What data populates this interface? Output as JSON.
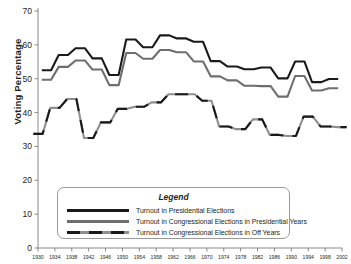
{
  "chart_data": {
    "type": "line",
    "title": "",
    "xlabel": "",
    "ylabel": "Voting Percentage",
    "ylim": [
      0,
      70
    ],
    "ytick_values": [
      0,
      10,
      20,
      30,
      40,
      50,
      60,
      70
    ],
    "ytick_labels": [
      "0",
      "10",
      "20",
      "30",
      "40",
      "50",
      "60",
      "70"
    ],
    "xlim": [
      1930,
      2002
    ],
    "xtick_labels": [
      "1930",
      "1934",
      "1938",
      "1942",
      "1946",
      "1950",
      "1954",
      "1958",
      "1962",
      "1966",
      "1970",
      "1974",
      "1978",
      "1982",
      "1986",
      "1990",
      "1994",
      "1998",
      "2002"
    ],
    "xtick_values": [
      1930,
      1934,
      1938,
      1942,
      1946,
      1950,
      1954,
      1958,
      1962,
      1966,
      1970,
      1974,
      1978,
      1982,
      1986,
      1990,
      1994,
      1998,
      2002
    ],
    "grid": false,
    "legend_position": "lower-center",
    "legend_title": "Legend",
    "series": [
      {
        "name": "Turnout in Presidential Elections",
        "color": "#1a1a1a",
        "style": "solid",
        "x": [
          1932,
          1936,
          1940,
          1944,
          1948,
          1952,
          1956,
          1960,
          1964,
          1968,
          1972,
          1976,
          1980,
          1984,
          1988,
          1992,
          1996,
          2000
        ],
        "values": [
          52.5,
          57.0,
          59.0,
          56.0,
          51.1,
          61.6,
          59.3,
          62.8,
          61.9,
          60.9,
          55.2,
          53.6,
          52.8,
          53.3,
          50.1,
          55.1,
          49.0,
          49.9
        ]
      },
      {
        "name": "Turnout in Congressional Elections in Presidential Years",
        "color": "#6e6e6e",
        "style": "solid",
        "x": [
          1932,
          1936,
          1940,
          1944,
          1948,
          1952,
          1956,
          1960,
          1964,
          1968,
          1972,
          1976,
          1980,
          1984,
          1988,
          1992,
          1996,
          2000
        ],
        "values": [
          49.7,
          53.5,
          55.4,
          52.7,
          48.1,
          57.6,
          55.9,
          58.5,
          57.8,
          55.1,
          50.7,
          49.5,
          47.9,
          47.8,
          44.7,
          50.8,
          46.5,
          47.2
        ]
      },
      {
        "name": "Turnout in Congressional Elections in Off Years",
        "color": "#1a1a1a",
        "style": "dashed",
        "x": [
          1930,
          1934,
          1938,
          1942,
          1946,
          1950,
          1954,
          1958,
          1962,
          1966,
          1970,
          1974,
          1978,
          1982,
          1986,
          1990,
          1994,
          1998,
          2002
        ],
        "values": [
          33.7,
          41.4,
          44.0,
          32.5,
          37.1,
          41.1,
          41.7,
          43.0,
          45.4,
          45.4,
          43.5,
          35.9,
          35.1,
          38.0,
          33.4,
          33.1,
          38.8,
          35.9,
          35.7
        ]
      }
    ]
  },
  "legend": {
    "title": "Legend",
    "items": [
      {
        "label": "Turnout in Presidential Elections"
      },
      {
        "label": "Turnout in Congressional Elections in Presidential Years"
      },
      {
        "label": "Turnout in Congressional Elections in Off Years"
      }
    ]
  },
  "axes": {
    "y_title": "Voting Percentage"
  }
}
